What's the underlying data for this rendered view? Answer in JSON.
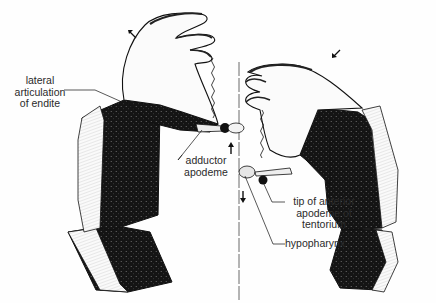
{
  "diagram": {
    "type": "biological illustration",
    "labels": {
      "lateral_articulation": [
        "lateral",
        "articulation",
        "of endite"
      ],
      "adductor_apodeme": [
        "adductor",
        "apodeme"
      ],
      "tentorium_tip": [
        "tip of anterior",
        "apodeme of",
        "tentorium"
      ],
      "hypopharynx": "hypopharynx"
    },
    "arrows": [
      {
        "id": "left-top",
        "direction": "up-left"
      },
      {
        "id": "right-top",
        "direction": "down-left"
      },
      {
        "id": "center-upper",
        "direction": "up"
      },
      {
        "id": "center-lower",
        "direction": "down"
      }
    ],
    "colors": {
      "ink": "#111111",
      "paper": "#fefefe",
      "shade": "#1a1a1a",
      "label": "#2a2a2a"
    }
  }
}
